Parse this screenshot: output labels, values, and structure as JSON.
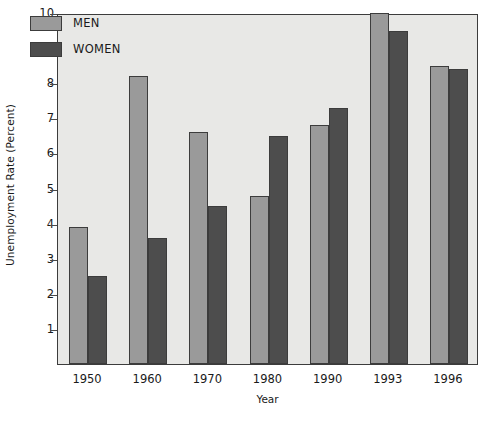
{
  "chart_data": {
    "type": "bar",
    "title": "",
    "subtitle": "",
    "xlabel": "Year",
    "ylabel": "Unemployment Rate (Percent)",
    "categories": [
      "1950",
      "1960",
      "1970",
      "1980",
      "1990",
      "1993",
      "1996"
    ],
    "series": [
      {
        "name": "MEN",
        "color": "#9a9a9a",
        "values": [
          3.9,
          8.2,
          6.6,
          4.8,
          6.8,
          10.0,
          8.5
        ]
      },
      {
        "name": "WOMEN",
        "color": "#4d4d4d",
        "values": [
          2.5,
          3.6,
          4.5,
          6.5,
          7.3,
          9.5,
          8.4
        ]
      }
    ],
    "ylim": [
      0,
      10
    ],
    "y_ticks": [
      "1",
      "2",
      "3",
      "4",
      "5",
      "6",
      "7",
      "8",
      "9",
      "10"
    ],
    "y_tick_values": [
      1,
      2,
      3,
      4,
      5,
      6,
      7,
      8,
      9,
      10
    ],
    "grid": false,
    "legend_position": "top-left",
    "plot_background": "#e8e8e6",
    "axis_color": "#3c3c3c"
  }
}
